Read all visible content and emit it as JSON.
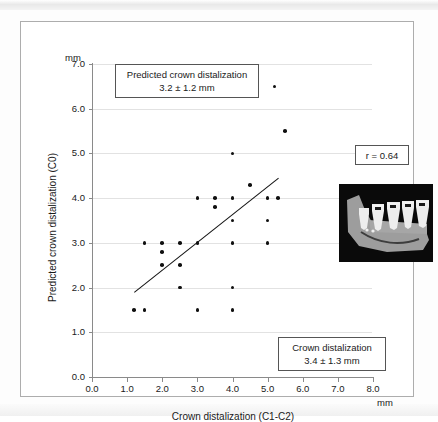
{
  "figure": {
    "unit_top": "mm",
    "unit_right": "mm",
    "correlation_box": "r = 0.64",
    "predicted_box_line1": "Predicted crown distalization",
    "predicted_box_line2": "3.2 ± 1.2 mm",
    "observed_box_line1": "Crown distalization",
    "observed_box_line2": "3.4 ± 1.3 mm",
    "inset_name": "dental-radiograph-mandible"
  },
  "colors": {
    "dot": "#101010",
    "gridline": "#e2e2e2",
    "axis": "#8a8a8a",
    "frame": "#adadad",
    "inset_background": "#0a0a0a",
    "inset_bone": "#9c9c9c",
    "inset_tooth": "#ededed"
  },
  "chart_data": {
    "type": "scatter",
    "title": "",
    "xlabel": "Crown distalization (C1-C2)",
    "ylabel": "Predicted crown distalization (C0)",
    "x_unit": "mm",
    "y_unit": "mm",
    "xlim": [
      0.0,
      8.0
    ],
    "ylim": [
      0.0,
      7.0
    ],
    "xticks": [
      "0.0",
      "1.0",
      "2.0",
      "3.0",
      "4.0",
      "5.0",
      "6.0",
      "7.0",
      "8.0"
    ],
    "yticks": [
      "0.0",
      "1.0",
      "2.0",
      "3.0",
      "4.0",
      "5.0",
      "6.0",
      "7.0"
    ],
    "grid": "horizontal",
    "legend_position": "none",
    "points": [
      [
        1.2,
        1.5
      ],
      [
        1.5,
        1.5
      ],
      [
        3.0,
        1.5
      ],
      [
        4.0,
        1.5
      ],
      [
        2.5,
        2.0
      ],
      [
        4.0,
        2.0
      ],
      [
        2.0,
        2.5
      ],
      [
        2.5,
        2.5
      ],
      [
        2.0,
        2.8
      ],
      [
        1.5,
        3.0
      ],
      [
        2.0,
        3.0
      ],
      [
        2.5,
        3.0
      ],
      [
        3.0,
        3.0
      ],
      [
        4.0,
        3.0
      ],
      [
        5.0,
        3.0
      ],
      [
        4.0,
        3.5
      ],
      [
        5.0,
        3.5
      ],
      [
        3.5,
        3.8
      ],
      [
        3.0,
        4.0
      ],
      [
        3.5,
        4.0
      ],
      [
        4.0,
        4.0
      ],
      [
        5.0,
        4.0
      ],
      [
        5.3,
        4.0
      ],
      [
        4.5,
        4.3
      ],
      [
        4.0,
        5.0
      ],
      [
        5.5,
        5.5
      ],
      [
        5.2,
        6.5
      ]
    ],
    "regression_line": {
      "x1": 1.2,
      "y1": 1.9,
      "x2": 5.3,
      "y2": 4.45,
      "r": 0.64
    },
    "annotations": [
      {
        "name": "predicted-mean",
        "text": "Predicted crown distalization 3.2 ± 1.2 mm"
      },
      {
        "name": "observed-mean",
        "text": "Crown distalization 3.4 ± 1.3 mm"
      },
      {
        "name": "correlation",
        "text": "r = 0.64"
      }
    ]
  }
}
